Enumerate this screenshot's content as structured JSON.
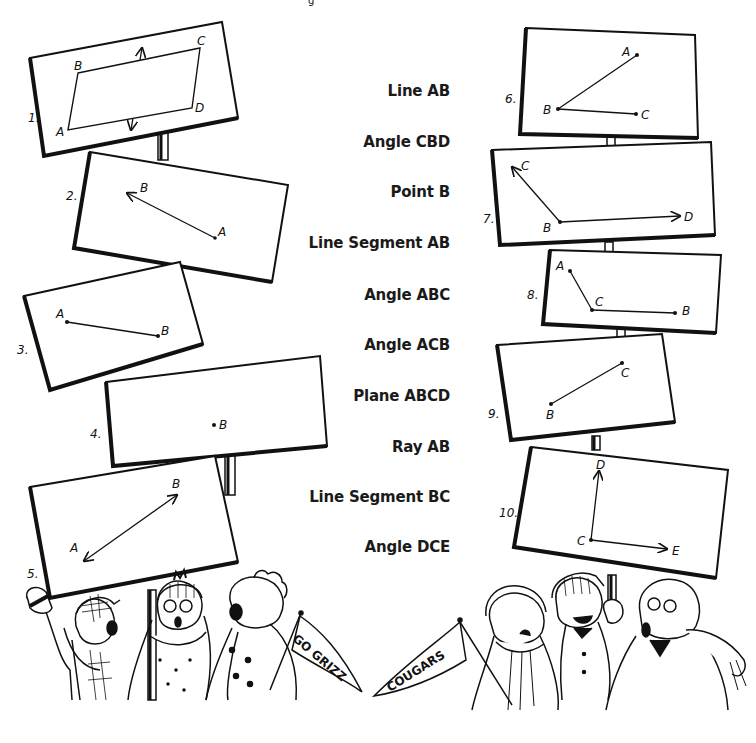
{
  "worksheet": {
    "header_fragment": "g",
    "terms": [
      {
        "label": "Line AB",
        "y": 92
      },
      {
        "label": "Angle CBD",
        "y": 143
      },
      {
        "label": "Point B",
        "y": 193
      },
      {
        "label": "Line Segment AB",
        "y": 244
      },
      {
        "label": "Angle ABC",
        "y": 296
      },
      {
        "label": "Angle ACB",
        "y": 346
      },
      {
        "label": "Plane ABCD",
        "y": 397
      },
      {
        "label": "Ray AB",
        "y": 448
      },
      {
        "label": "Line Segment BC",
        "y": 498
      },
      {
        "label": "Angle DCE",
        "y": 548
      }
    ],
    "signs": [
      {
        "number": "1.",
        "figure": "plane",
        "points": [
          "A",
          "B",
          "C",
          "D"
        ]
      },
      {
        "number": "2.",
        "figure": "ray",
        "points": [
          "A",
          "B"
        ]
      },
      {
        "number": "3.",
        "figure": "segment",
        "points": [
          "A",
          "B"
        ]
      },
      {
        "number": "4.",
        "figure": "point",
        "points": [
          "B"
        ]
      },
      {
        "number": "5.",
        "figure": "line",
        "points": [
          "A",
          "B"
        ]
      },
      {
        "number": "6.",
        "figure": "angle",
        "points": [
          "A",
          "B",
          "C"
        ]
      },
      {
        "number": "7.",
        "figure": "angle",
        "points": [
          "C",
          "B",
          "D"
        ]
      },
      {
        "number": "8.",
        "figure": "angle",
        "points": [
          "A",
          "C",
          "B"
        ]
      },
      {
        "number": "9.",
        "figure": "segment",
        "points": [
          "B",
          "C"
        ]
      },
      {
        "number": "10.",
        "figure": "angle",
        "points": [
          "D",
          "C",
          "E"
        ]
      }
    ],
    "pennants": {
      "left": "GO GRIZZ",
      "right": "COUGARS"
    },
    "colors": {
      "ink": "#111111",
      "paper": "#ffffff"
    }
  }
}
